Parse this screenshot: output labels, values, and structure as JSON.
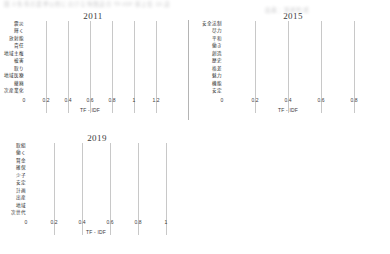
{
  "caption": {
    "line1": "図 3  各年の選挙公約における特徴語の TF-IDF 値上位 10 語",
    "line2": "出典：筆者作成"
  },
  "axis_title": "TF - IDF",
  "chart_data": [
    {
      "type": "bar",
      "orientation": "horizontal",
      "title": "2011",
      "xlabel": "TF - IDF",
      "ylabel": "",
      "xlim": [
        0,
        1.2
      ],
      "xticks": [
        0,
        0.2,
        0.4,
        0.6,
        0.8,
        1,
        1.2
      ],
      "xticklabels": [
        "0",
        "0.2",
        "0.4",
        "0.6",
        "0.8",
        "1",
        "1.2"
      ],
      "grid": true,
      "bar_color": "#3a3a3a",
      "categories": [
        "震災",
        "輝く",
        "放射能",
        "責任",
        "地域主権",
        "被害",
        "取り",
        "地域医療",
        "撤廃",
        "次産業化"
      ],
      "values": [
        1.0,
        1.0,
        0.86,
        0.8,
        0.76,
        0.75,
        0.73,
        0.72,
        0.71,
        0.69
      ]
    },
    {
      "type": "bar",
      "orientation": "horizontal",
      "title": "2015",
      "xlabel": "TF - IDF",
      "ylabel": "",
      "xlim": [
        0,
        0.8
      ],
      "xticks": [
        0,
        0.2,
        0.4,
        0.6,
        0.8
      ],
      "xticklabels": [
        "0",
        "0.2",
        "0.4",
        "0.6",
        "0.8"
      ],
      "grid": true,
      "bar_color": "#3a3a3a",
      "categories": [
        "安全法制",
        "尽力",
        "平和",
        "働き",
        "創造",
        "歴史",
        "格差",
        "魅力",
        "機能",
        "安定"
      ],
      "values": [
        0.74,
        0.66,
        0.53,
        0.49,
        0.45,
        0.45,
        0.42,
        0.42,
        0.4,
        0.4
      ]
    },
    {
      "type": "bar",
      "orientation": "horizontal",
      "title": "2019",
      "xlabel": "TF - IDF",
      "ylabel": "",
      "xlim": [
        0,
        1.0
      ],
      "xticks": [
        0,
        0.2,
        0.4,
        0.6,
        0.8,
        1
      ],
      "xticklabels": [
        "0",
        "0.2",
        "0.4",
        "0.6",
        "0.8",
        "1"
      ],
      "grid": true,
      "bar_color": "#3a3a3a",
      "categories": [
        "取組",
        "働く",
        "賢金",
        "確保",
        "少子",
        "安定",
        "計画",
        "出産",
        "地域",
        "次世代"
      ],
      "values": [
        0.86,
        0.56,
        0.54,
        0.47,
        0.46,
        0.45,
        0.44,
        0.43,
        0.42,
        0.38
      ]
    }
  ]
}
